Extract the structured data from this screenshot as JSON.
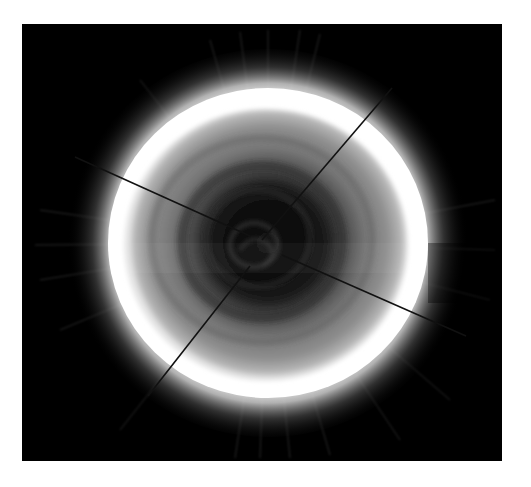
{
  "image": {
    "description": "Polar view of a planet: dark central vortex surrounded by gray banded disk, bright white limb ring and faint radial halo streaks, crossed by four thin dark diagonal lines",
    "colors": {
      "background": "#ffffff",
      "frame": "#000000",
      "limb": "#ffffff",
      "disk_mid": "#8a8a8a",
      "disk_inner": "#5a5a5a",
      "vortex": "#0c0c0c",
      "line": "#111111"
    },
    "frame": {
      "x": 22,
      "y": 24,
      "width": 480,
      "height": 437
    },
    "disk": {
      "cx": 268,
      "cy": 243,
      "rx": 160,
      "ry": 155
    },
    "seam_y": 243,
    "lines": [
      {
        "name": "upper-right",
        "x1": 392,
        "y1": 88,
        "x2": 262,
        "y2": 240
      },
      {
        "name": "left",
        "x1": 75,
        "y1": 157,
        "x2": 250,
        "y2": 236
      },
      {
        "name": "lower-right",
        "x1": 282,
        "y1": 255,
        "x2": 466,
        "y2": 336
      },
      {
        "name": "lower-left",
        "x1": 250,
        "y1": 266,
        "x2": 148,
        "y2": 396
      }
    ]
  }
}
